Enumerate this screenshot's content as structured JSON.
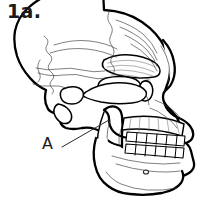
{
  "figure": {
    "number_label": "1a.",
    "view": "left lateral",
    "style": "black-and-white line art / ink drawing",
    "background_color": "#ffffff",
    "outline_color": "#000000",
    "suture_line_color": "#3a3a3a",
    "shading_color": "#a8a8a8",
    "callouts": [
      {
        "id": "A",
        "label": "A",
        "label_x": 42,
        "label_y": 136,
        "leader_from_x": 62,
        "leader_from_y": 147,
        "leader_to_x": 109,
        "leader_to_y": 120,
        "points_to": "mandibular ramus / jaw"
      }
    ],
    "anatomy_parts": [
      "cranial vault",
      "coronal suture",
      "lambdoid suture",
      "temporal line",
      "supraorbital torus (brow ridge)",
      "orbit",
      "nasal aperture",
      "zygomatic arch",
      "external auditory meatus",
      "mastoid process",
      "maxilla",
      "upper tooth row",
      "lower tooth row",
      "mandibular ramus",
      "mandibular body",
      "mental foramen"
    ],
    "teeth": {
      "upper_row_count": 6,
      "lower_row_count": 6
    }
  }
}
